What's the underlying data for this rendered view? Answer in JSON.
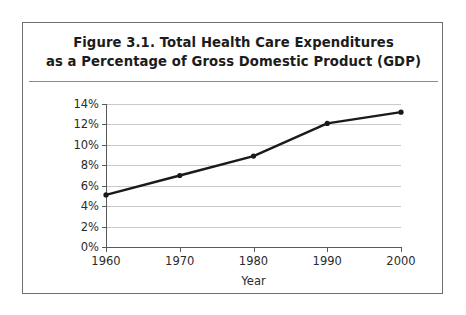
{
  "figure": {
    "title_line1": "Figure 3.1.  Total Health Care Expenditures",
    "title_line2": "as a Percentage of Gross Domestic Product (GDP)"
  },
  "chart_data": {
    "type": "line",
    "title": "Figure 3.1.  Total Health Care Expenditures as a Percentage of Gross Domestic Product (GDP)",
    "xlabel": "Year",
    "ylabel": "",
    "x": [
      1960,
      1970,
      1980,
      1990,
      2000
    ],
    "categories": [
      "1960",
      "1970",
      "1980",
      "1990",
      "2000"
    ],
    "values": [
      5.1,
      7.0,
      8.9,
      12.1,
      13.2
    ],
    "series": [
      {
        "name": "Total health care expenditures as a percentage of GDP",
        "values": [
          5.1,
          7.0,
          8.9,
          12.1,
          13.2
        ]
      }
    ],
    "xlim": [
      1960,
      2000
    ],
    "ylim": [
      0,
      14
    ],
    "ytick_labels": [
      "0%",
      "2%",
      "4%",
      "6%",
      "8%",
      "10%",
      "12%",
      "14%"
    ],
    "ytick_values": [
      0,
      2,
      4,
      6,
      8,
      10,
      12,
      14
    ],
    "xtick_labels": [
      "1960",
      "1970",
      "1980",
      "1990",
      "2000"
    ],
    "grid": "horizontal",
    "legend": "none",
    "line_color": "#1a1a1a",
    "marker": "circle",
    "gridline_color": "#c9c9c9",
    "axis_color": "#595959"
  }
}
